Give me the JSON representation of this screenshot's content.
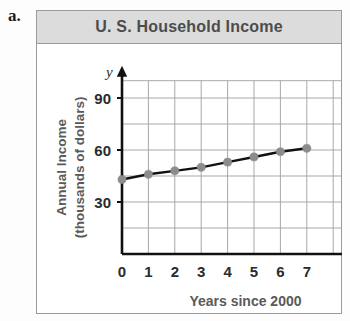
{
  "problem": {
    "label": "a."
  },
  "figure": {
    "title": "U. S. Household Income",
    "title_bar_color": "#dcdcdc",
    "border_color": "#9a9a9a"
  },
  "chart_data": {
    "type": "line",
    "title": "U. S. Household Income",
    "xlabel": "Years since 2000",
    "ylabel": "Annual Income (thousands of dollars)",
    "ylabel_line1": "Annual Income",
    "ylabel_line2": "(thousands of dollars)",
    "x_axis_variable": "x",
    "y_axis_variable": "y",
    "x": [
      0,
      1,
      2,
      3,
      4,
      5,
      6,
      7
    ],
    "values": [
      43,
      46,
      48,
      50,
      53,
      56,
      59,
      61
    ],
    "x_tick_labels": [
      "0",
      "1",
      "2",
      "3",
      "4",
      "5",
      "6",
      "7"
    ],
    "y_tick_labels": [
      "30",
      "60",
      "90"
    ],
    "y_tick_values": [
      30,
      60,
      90
    ],
    "xlim": [
      0,
      7.5
    ],
    "ylim": [
      0,
      105
    ],
    "y_gridline_step": 15,
    "x_gridline_step": 1,
    "grid": true,
    "legend": "none",
    "line_color": "#111111",
    "point_color": "#8c8c8c",
    "grid_color": "#9f9f9f",
    "axis_color": "#111111"
  }
}
